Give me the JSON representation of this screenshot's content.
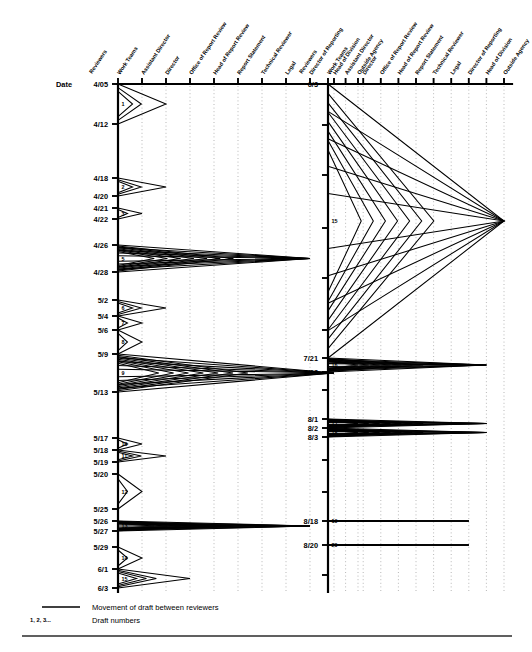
{
  "figure": {
    "axis_title": "Date",
    "reviewers_header": "Reviewers"
  },
  "columns": [
    {
      "id": "work-teams",
      "label": "Work Teams"
    },
    {
      "id": "assistant-director",
      "label": "Assistant Director"
    },
    {
      "id": "director",
      "label": "Director"
    },
    {
      "id": "office-of-report-review",
      "label": "Office of Report Review"
    },
    {
      "id": "head-of-report-review",
      "label": "Head of Report Review"
    },
    {
      "id": "report-statement",
      "label": "Report Statement"
    },
    {
      "id": "technical-reviewer",
      "label": "Technical Reviewer"
    },
    {
      "id": "legal",
      "label": "Legal"
    },
    {
      "id": "director-of-reporting",
      "label": "Director of Reporting"
    },
    {
      "id": "head-of-division",
      "label": "Head of Division"
    },
    {
      "id": "outside-agency",
      "label": "Outside Agency"
    }
  ],
  "legend": {
    "line_label": "Movement of draft between reviewers",
    "numbers_sample": "1, 2, 3...",
    "numbers_label": "Draft numbers"
  },
  "chart_data": {
    "type": "line",
    "title": "Movement of draft between reviewers",
    "xlabel": "Reviewers",
    "ylabel": "Date",
    "grid": true,
    "legend_position": "bottom-left",
    "panels": [
      {
        "id": "panel-left",
        "date_ticks": [
          "4/05",
          "4/12",
          "4/18",
          "4/20",
          "4/21",
          "4/22",
          "4/26",
          "4/28",
          "5/2",
          "5/4",
          "5/6",
          "5/9",
          "5/13",
          "5/17",
          "5/18",
          "5/19",
          "5/20",
          "5/25",
          "5/26",
          "5/27",
          "5/29",
          "6/1",
          "6/3"
        ],
        "draft_numbers": [
          "1",
          "2",
          "3",
          "5",
          "6",
          "7",
          "8",
          "9",
          "10",
          "11",
          "12",
          "13",
          "14",
          "15"
        ],
        "drafts": [
          {
            "n": "1",
            "from_date": "4/05",
            "to_date": "4/12",
            "max_column": "director"
          },
          {
            "n": "2",
            "from_date": "4/18",
            "to_date": "4/20",
            "max_column": "director"
          },
          {
            "n": "3",
            "from_date": "4/21",
            "to_date": "4/22",
            "max_column": "assistant-director"
          },
          {
            "n": "5",
            "from_date": "4/26",
            "to_date": "4/28",
            "max_column": "director-of-reporting"
          },
          {
            "n": "6",
            "from_date": "5/2",
            "to_date": "5/4",
            "max_column": "director"
          },
          {
            "n": "7",
            "from_date": "5/4",
            "to_date": "5/6",
            "max_column": "assistant-director"
          },
          {
            "n": "8",
            "from_date": "5/6",
            "to_date": "5/9",
            "max_column": "assistant-director"
          },
          {
            "n": "9",
            "from_date": "5/9",
            "to_date": "5/13",
            "max_column": "head-of-division"
          },
          {
            "n": "10",
            "from_date": "5/17",
            "to_date": "5/18",
            "max_column": "assistant-director"
          },
          {
            "n": "11",
            "from_date": "5/18",
            "to_date": "5/19",
            "max_column": "director"
          },
          {
            "n": "12",
            "from_date": "5/20",
            "to_date": "5/25",
            "max_column": "assistant-director"
          },
          {
            "n": "13",
            "from_date": "5/26",
            "to_date": "5/27",
            "max_column": "director-of-reporting"
          },
          {
            "n": "14",
            "from_date": "5/29",
            "to_date": "6/1",
            "max_column": "assistant-director"
          },
          {
            "n": "15",
            "from_date": "6/1",
            "to_date": "6/3",
            "max_column": "office-of-report-review"
          }
        ]
      },
      {
        "id": "panel-right",
        "date_ticks": [
          "6/3",
          "7/21",
          "7/23",
          "8/1",
          "8/2",
          "8/3",
          "8/18",
          "8/20"
        ],
        "draft_numbers": [
          "15",
          "16",
          "17",
          "18",
          "19",
          "20"
        ],
        "drafts": [
          {
            "n": "15",
            "from_date": "6/3",
            "to_date": "7/21",
            "max_column": "outside-agency"
          },
          {
            "n": "16",
            "from_date": "7/21",
            "to_date": "7/23",
            "max_column": "head-of-division"
          },
          {
            "n": "17",
            "from_date": "8/1",
            "to_date": "8/2",
            "max_column": "head-of-division"
          },
          {
            "n": "18",
            "from_date": "8/2",
            "to_date": "8/3",
            "max_column": "head-of-division"
          },
          {
            "n": "19",
            "from_date": "8/18",
            "to_date": "8/18",
            "max_column": "director-of-reporting"
          },
          {
            "n": "20",
            "from_date": "8/20",
            "to_date": "8/20",
            "max_column": "director-of-reporting"
          }
        ]
      }
    ]
  }
}
